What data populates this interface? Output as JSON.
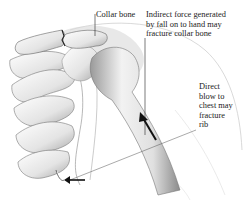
{
  "figure": {
    "labels": {
      "collar_bone": "Collar bone",
      "indirect_force": "Indirect force generated\nby fall on to hand may\nfracture collar bone",
      "direct_blow": "Direct\nblow to\nchest may\nfracture\nrib"
    }
  }
}
